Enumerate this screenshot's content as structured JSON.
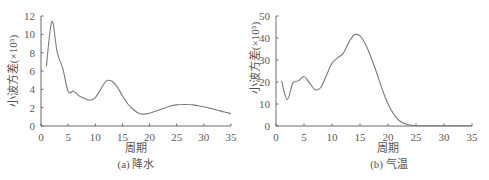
{
  "chart_data": [
    {
      "type": "line",
      "title": "",
      "caption": "(a) 降水",
      "xlabel": "周期",
      "ylabel": "小波方差(×10⁵)",
      "xlim": [
        0,
        35
      ],
      "ylim": [
        0,
        12
      ],
      "xticks": [
        0,
        5,
        10,
        15,
        20,
        25,
        30,
        35
      ],
      "yticks": [
        0,
        2,
        4,
        6,
        8,
        10,
        12
      ],
      "grid": false,
      "legend": null,
      "series": [
        {
          "name": "降水",
          "x": [
            1,
            2,
            3,
            4,
            5,
            6,
            7,
            8,
            9,
            10,
            11,
            12,
            13,
            14,
            15,
            16,
            17,
            18,
            19,
            20,
            21,
            22,
            23,
            24,
            25,
            26,
            27,
            28,
            29,
            30,
            31,
            32,
            33,
            34,
            35
          ],
          "values": [
            6.5,
            11.4,
            8.0,
            6.3,
            3.8,
            3.8,
            3.3,
            3.0,
            2.8,
            3.1,
            4.0,
            4.9,
            4.9,
            4.3,
            3.3,
            2.4,
            1.8,
            1.4,
            1.3,
            1.4,
            1.6,
            1.8,
            2.0,
            2.2,
            2.3,
            2.35,
            2.35,
            2.3,
            2.2,
            2.1,
            1.95,
            1.8,
            1.65,
            1.5,
            1.35
          ]
        }
      ]
    },
    {
      "type": "line",
      "title": "",
      "caption": "(b) 气温",
      "xlabel": "周期",
      "ylabel": "小波方差(×10⁵)",
      "xlim": [
        0,
        35
      ],
      "ylim": [
        0,
        50
      ],
      "xticks": [
        0,
        5,
        10,
        15,
        20,
        25,
        30,
        35
      ],
      "yticks": [
        0,
        10,
        20,
        30,
        40,
        50
      ],
      "grid": false,
      "legend": null,
      "series": [
        {
          "name": "气温",
          "x": [
            1,
            2,
            3,
            4,
            5,
            6,
            7,
            8,
            9,
            10,
            11,
            12,
            13,
            14,
            15,
            16,
            17,
            18,
            19,
            20,
            21,
            22,
            23,
            24,
            25,
            26,
            27,
            28,
            29,
            30,
            31,
            32,
            33,
            34,
            35
          ],
          "values": [
            20.5,
            12,
            19.5,
            20.5,
            22.5,
            19.5,
            16.5,
            17.5,
            23,
            28.5,
            31,
            33,
            38,
            41.5,
            41,
            37,
            31,
            24,
            16.5,
            10,
            5.5,
            2.5,
            1,
            0.4,
            0.2,
            0.1,
            0.1,
            0.1,
            0.1,
            0.1,
            0.1,
            0.1,
            0.1,
            0.1,
            0.1
          ]
        }
      ]
    }
  ],
  "panels": {
    "a": {
      "xlabel": "周期",
      "ylabel": "小波方差(×10⁵)",
      "caption": "(a) 降水"
    },
    "b": {
      "xlabel": "周期",
      "ylabel": "小波方差(×10⁵)",
      "caption": "(b) 气温"
    }
  }
}
